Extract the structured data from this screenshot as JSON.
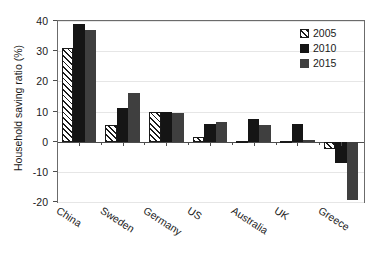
{
  "chart_data": {
    "type": "bar",
    "title": "",
    "xlabel": "",
    "ylabel": "Household saving ratio (%)",
    "ylim": [
      -20,
      40
    ],
    "yticks": [
      40,
      30,
      20,
      10,
      0,
      -10,
      -20
    ],
    "ytick_labels": [
      "40",
      "30",
      "20",
      "10",
      "0",
      "-10",
      "-20"
    ],
    "grid": true,
    "grid_axis": "y",
    "legend_position": "top-right",
    "categories": [
      "China",
      "Sweden",
      "Germany",
      "US",
      "Australia",
      "UK",
      "Greece"
    ],
    "series": [
      {
        "name": "2005",
        "color": "#ffffff",
        "edge_color": "#1a1a1a",
        "pattern": "diagonal-hatch",
        "values": [
          31.0,
          5.5,
          9.8,
          1.5,
          0.3,
          0.2,
          -2.5
        ]
      },
      {
        "name": "2010",
        "color": "#151515",
        "edge_color": "#151515",
        "pattern": "solid",
        "values": [
          39.0,
          11.0,
          10.0,
          6.0,
          7.5,
          6.0,
          -7.0
        ]
      },
      {
        "name": "2015",
        "color": "#3f3f3f",
        "edge_color": "#3f3f3f",
        "pattern": "solid",
        "values": [
          37.0,
          16.0,
          9.5,
          6.5,
          5.5,
          0.5,
          -19.5
        ]
      }
    ]
  },
  "legend": {
    "entries": [
      {
        "label": "2005"
      },
      {
        "label": "2010"
      },
      {
        "label": "2015"
      }
    ]
  }
}
